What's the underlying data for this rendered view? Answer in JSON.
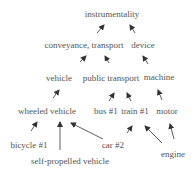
{
  "diagram": {
    "colors": {
      "text": "#555555",
      "arrow": "#333333",
      "background": "#ffffff"
    },
    "nodes": [
      {
        "id": "instrumentality",
        "label": "instrumentality",
        "x": 112,
        "y": 14
      },
      {
        "id": "conveyance",
        "label": "conveyance, transport",
        "x": 84,
        "y": 45
      },
      {
        "id": "device",
        "label": "device",
        "x": 143,
        "y": 45
      },
      {
        "id": "vehicle",
        "label": "vehicle",
        "x": 59,
        "y": 78
      },
      {
        "id": "public_transport",
        "label": "public transport",
        "x": 111,
        "y": 78
      },
      {
        "id": "machine",
        "label": "machine",
        "x": 159,
        "y": 77
      },
      {
        "id": "wheeled_vehicle",
        "label": "wheeled vehicle",
        "x": 47,
        "y": 111
      },
      {
        "id": "bus1",
        "label": "bus #1",
        "x": 106,
        "y": 111
      },
      {
        "id": "train1",
        "label": "train #1",
        "x": 135,
        "y": 111
      },
      {
        "id": "motor",
        "label": "motor",
        "x": 167,
        "y": 111
      },
      {
        "id": "bicycle1",
        "label": "bicycle #1",
        "x": 29,
        "y": 145
      },
      {
        "id": "car2",
        "label": "car #2",
        "x": 113,
        "y": 145
      },
      {
        "id": "engine",
        "label": "engine",
        "x": 173,
        "y": 154
      },
      {
        "id": "self_propelled",
        "label": "self-propelled vehicle",
        "x": 70,
        "y": 161
      }
    ],
    "edges": [
      {
        "from": "conveyance",
        "to": "instrumentality",
        "x1": 97,
        "y1": 33,
        "x2": 104,
        "y2": 25
      },
      {
        "from": "device",
        "to": "instrumentality",
        "x1": 135,
        "y1": 33,
        "x2": 130,
        "y2": 25
      },
      {
        "from": "vehicle",
        "to": "conveyance",
        "x1": 80,
        "y1": 62,
        "x2": 86,
        "y2": 56
      },
      {
        "from": "public_transport",
        "to": "conveyance",
        "x1": 109,
        "y1": 63,
        "x2": 105,
        "y2": 56
      },
      {
        "from": "machine",
        "to": "device",
        "x1": 148,
        "y1": 64,
        "x2": 143,
        "y2": 56
      },
      {
        "from": "wheeled_vehicle",
        "to": "vehicle",
        "x1": 53,
        "y1": 98,
        "x2": 59,
        "y2": 90
      },
      {
        "from": "bus1",
        "to": "public_transport",
        "x1": 109,
        "y1": 101,
        "x2": 114,
        "y2": 93
      },
      {
        "from": "train1",
        "to": "public_transport",
        "x1": 131,
        "y1": 101,
        "x2": 127,
        "y2": 93
      },
      {
        "from": "motor",
        "to": "machine",
        "x1": 162,
        "y1": 100,
        "x2": 158,
        "y2": 90
      },
      {
        "from": "bicycle1",
        "to": "wheeled_vehicle",
        "x1": 31,
        "y1": 131,
        "x2": 37,
        "y2": 122
      },
      {
        "from": "self_propelled",
        "to": "wheeled_vehicle",
        "x1": 60,
        "y1": 150,
        "x2": 60,
        "y2": 122
      },
      {
        "from": "car2",
        "to": "wheeled_vehicle",
        "x1": 103,
        "y1": 139,
        "x2": 71,
        "y2": 123
      },
      {
        "from": "car2",
        "to": "train1",
        "x1": 127,
        "y1": 133,
        "x2": 132,
        "y2": 126
      },
      {
        "from": "engine",
        "to": "train1",
        "x1": 162,
        "y1": 143,
        "x2": 145,
        "y2": 126
      },
      {
        "from": "engine",
        "to": "motor",
        "x1": 174,
        "y1": 139,
        "x2": 170,
        "y2": 124
      }
    ]
  }
}
